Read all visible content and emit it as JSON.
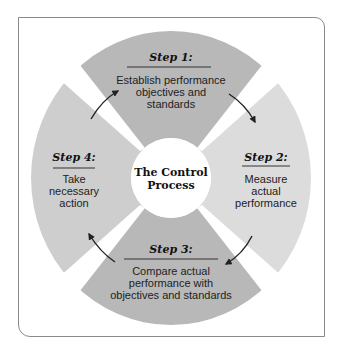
{
  "diagram": {
    "center_label": [
      "The Control",
      "Process"
    ],
    "steps": [
      {
        "title": "Step 1:",
        "lines": [
          "Establish performance",
          "objectives and",
          "standards"
        ],
        "position": "top",
        "color": "#b8b8b8"
      },
      {
        "title": "Step 2:",
        "lines": [
          "Measure",
          "actual",
          "performance"
        ],
        "position": "right",
        "color": "#dcdcdc"
      },
      {
        "title": "Step 3:",
        "lines": [
          "Compare actual",
          "performance with",
          "objectives and standards"
        ],
        "position": "bottom",
        "color": "#b8b8b8"
      },
      {
        "title": "Step 4:",
        "lines": [
          "Take",
          "necessary",
          "action"
        ],
        "position": "left",
        "color": "#cecece"
      }
    ],
    "flow": [
      "Step 1 -> Step 2",
      "Step 2 -> Step 3",
      "Step 3 -> Step 4",
      "Step 4 -> Step 1"
    ]
  }
}
